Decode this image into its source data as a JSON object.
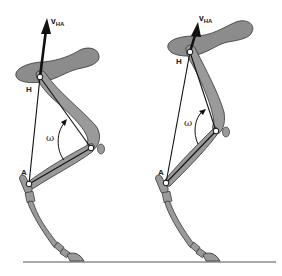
{
  "figure": {
    "type": "biomechanics-diagram",
    "colors": {
      "bone_fill": "#9a9a9a",
      "bone_stroke": "#3a3a3a",
      "pelvis_fill": "#8c8c8c",
      "line": "#111111",
      "ground": "#555555"
    }
  },
  "panels": [
    {
      "id": "left",
      "labels": {
        "velocity": "v",
        "velocity_sub": "HA",
        "hip": "H",
        "ankle": "A",
        "angle": "ω"
      },
      "points": {
        "hip": [
          40,
          77
        ],
        "ankle": [
          29,
          184
        ],
        "knee": [
          91,
          148
        ],
        "arrow_tip": [
          47,
          18
        ]
      }
    },
    {
      "id": "right",
      "labels": {
        "velocity": "v",
        "velocity_sub": "HA",
        "hip": "H",
        "ankle": "A",
        "angle": "ω"
      },
      "points": {
        "hip": [
          190,
          52
        ],
        "ankle": [
          166,
          183
        ],
        "knee": [
          216,
          131
        ],
        "arrow_tip": [
          198,
          22
        ]
      }
    }
  ],
  "ground": {
    "y": 262,
    "x1": 23,
    "x2": 276
  }
}
